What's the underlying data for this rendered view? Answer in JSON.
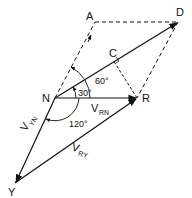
{
  "diagram": {
    "points": {
      "N": {
        "label": "N",
        "x": 55,
        "y": 98
      },
      "R": {
        "label": "R",
        "x": 137,
        "y": 98
      },
      "D": {
        "label": "D",
        "x": 178,
        "y": 22
      },
      "A": {
        "label": "A",
        "x": 95,
        "y": 22
      },
      "Y": {
        "label": "Y",
        "x": 15,
        "y": 183
      },
      "C": {
        "label": "C",
        "x": 113,
        "y": 60
      }
    },
    "vectors": [
      {
        "name": "V_RN",
        "main": "V",
        "sub": "RN",
        "from": "N",
        "to": "R"
      },
      {
        "name": "V_YN",
        "main": "V",
        "sub": "YN",
        "from": "N",
        "to": "Y"
      },
      {
        "name": "V_RY",
        "main": "V",
        "sub": "RY",
        "from": "Y",
        "to": "R"
      },
      {
        "name": "ND",
        "from": "N",
        "to": "D"
      }
    ],
    "angles": [
      {
        "label": "30°"
      },
      {
        "label": "60°"
      },
      {
        "label": "120°"
      }
    ],
    "labels": {
      "N": "N",
      "R": "R",
      "D": "D",
      "A": "A",
      "Y": "Y",
      "C": "C",
      "v_main": "V",
      "v_rn_sub": "RN",
      "v_yn_sub": "YN",
      "v_ry_sub": "RY",
      "angle_30": "30°",
      "angle_60": "60°",
      "angle_120": "120°"
    },
    "colors": {
      "stroke": "#111111",
      "background": "#ffffff"
    }
  }
}
